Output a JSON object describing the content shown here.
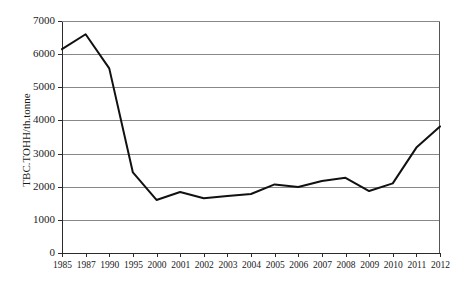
{
  "chart_data": {
    "type": "line",
    "title": "",
    "xlabel": "",
    "ylabel": "TBC.TOHH/th.tonne",
    "ylim": [
      0,
      7000
    ],
    "ytick_values": [
      0,
      1000,
      2000,
      3000,
      4000,
      5000,
      6000,
      7000
    ],
    "ytick_labels": [
      "0",
      "1000",
      "2000",
      "3000",
      "4000",
      "5000",
      "6000",
      "7000"
    ],
    "grid": true,
    "legend": false,
    "legend_position": "none",
    "categories": [
      "1985",
      "1987",
      "1990",
      "1995",
      "2000",
      "2001",
      "2002",
      "2003",
      "2004",
      "2005",
      "2006",
      "2007",
      "2008",
      "2009",
      "2010",
      "2011",
      "2012"
    ],
    "values": [
      6150,
      6600,
      5570,
      2430,
      1600,
      1840,
      1650,
      1720,
      1780,
      2070,
      1990,
      2170,
      2270,
      1870,
      2100,
      3180,
      3820
    ],
    "series": [
      {
        "name": "TBC.TOHH",
        "values": [
          6150,
          6600,
          5570,
          2430,
          1600,
          1840,
          1650,
          1720,
          1780,
          2070,
          1990,
          2170,
          2270,
          1870,
          2100,
          3180,
          3820
        ]
      }
    ]
  }
}
